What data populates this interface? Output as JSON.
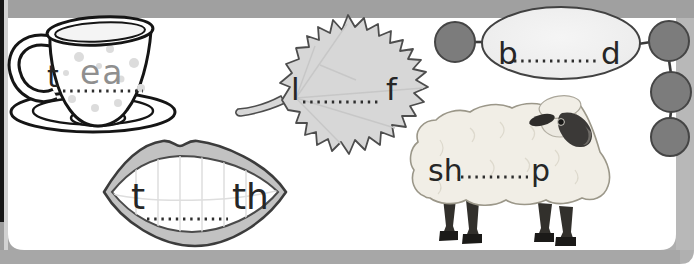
{
  "worksheet": {
    "description": "phonics fill-in-the-blank worksheet (ee/ea words)",
    "items": [
      {
        "word": "tea",
        "illustration": "teacup",
        "prefix": "t",
        "suffix": "",
        "answer": "ea"
      },
      {
        "word": "leaf",
        "illustration": "leaf",
        "prefix": "l",
        "suffix": "f",
        "answer": ""
      },
      {
        "word": "bead",
        "illustration": "bead-string",
        "prefix": "b",
        "suffix": "d",
        "answer": ""
      },
      {
        "word": "teeth",
        "illustration": "lips",
        "prefix": "t",
        "suffix": "th",
        "answer": ""
      },
      {
        "word": "sheep",
        "illustration": "sheep",
        "prefix": "sh",
        "suffix": "p",
        "answer": ""
      }
    ],
    "colors": {
      "page": "#ffffff",
      "top_band": "#a0a0a0",
      "right_band": "#b8b8b8",
      "bottom_band": "#a7a7a7",
      "spine_edge": "#161616",
      "leaf_fill": "#d7d7d7",
      "lips_fill": "#c2c2c2",
      "bead_fill": "#7c7c7c",
      "sheep_wool": "#f1eee6",
      "sheep_face": "#3b3937",
      "letter_ink": "#262626",
      "answer_ink": "#8f8f8f"
    }
  }
}
